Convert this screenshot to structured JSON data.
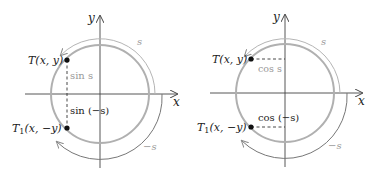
{
  "colors": {
    "axis": "#444444",
    "circle": "#b0b0b0",
    "arc": "#9a9a9a",
    "point": "#111111",
    "dashed": "#333333",
    "label": "#222222",
    "label_gray": "#999999"
  },
  "left_panel": {
    "axis_x_label": "x",
    "axis_y_label": "y",
    "point_T": {
      "name": "T",
      "coords": "(x, y)"
    },
    "point_T1": {
      "name": "T",
      "sub": "1",
      "coords": "(x, −y)"
    },
    "segment_upper_label": "sin s",
    "segment_lower_label": "sin (−s)",
    "arc_upper_label": "s",
    "arc_lower_label": "−s"
  },
  "right_panel": {
    "axis_x_label": "x",
    "axis_y_label": "y",
    "point_T": {
      "name": "T",
      "coords": "(x, y)"
    },
    "point_T1": {
      "name": "T",
      "sub": "1",
      "coords": "(x, −y)"
    },
    "segment_upper_label": "cos s",
    "segment_lower_label": "cos (−s)",
    "arc_upper_label": "s",
    "arc_lower_label": "−s"
  }
}
